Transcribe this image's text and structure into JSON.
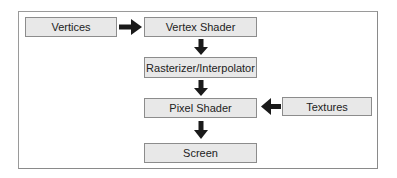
{
  "diagram": {
    "type": "flowchart",
    "title": "",
    "nodes": [
      {
        "id": "vertices",
        "label": "Vertices"
      },
      {
        "id": "vertex_shader",
        "label": "Vertex Shader"
      },
      {
        "id": "rasterizer",
        "label": "Rasterizer/Interpolator"
      },
      {
        "id": "pixel_shader",
        "label": "Pixel Shader"
      },
      {
        "id": "textures",
        "label": "Textures"
      },
      {
        "id": "screen",
        "label": "Screen"
      }
    ],
    "edges": [
      {
        "from": "vertices",
        "to": "vertex_shader",
        "direction": "right"
      },
      {
        "from": "vertex_shader",
        "to": "rasterizer",
        "direction": "down"
      },
      {
        "from": "rasterizer",
        "to": "pixel_shader",
        "direction": "down"
      },
      {
        "from": "textures",
        "to": "pixel_shader",
        "direction": "left"
      },
      {
        "from": "pixel_shader",
        "to": "screen",
        "direction": "down"
      }
    ],
    "colors": {
      "box_fill": "#e8e8e8",
      "box_border": "#8c8c8c",
      "arrow": "#1a1a1a",
      "frame": "#9a9a9a"
    }
  }
}
